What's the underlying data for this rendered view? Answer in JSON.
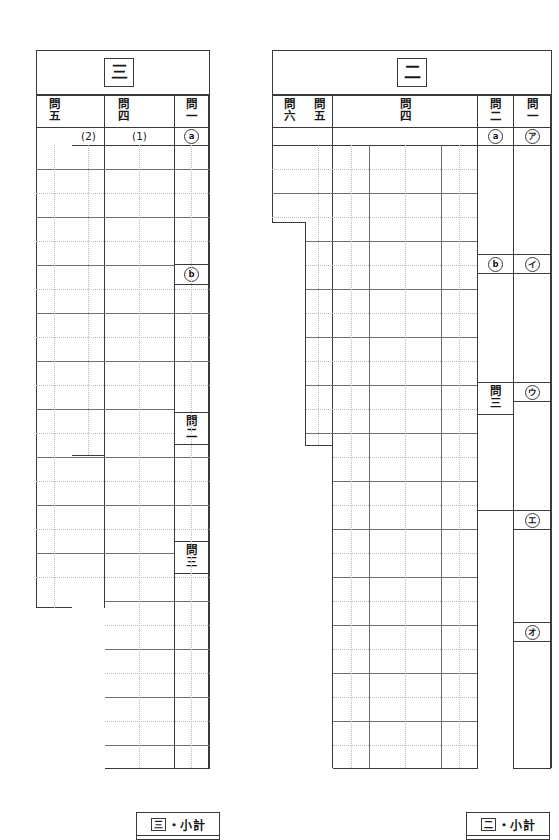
{
  "page": {
    "kind": "japanese-exam-answer-sheet",
    "width": 559,
    "height": 840,
    "background": "#ffffff",
    "rule_color": "#6e6e73",
    "outline_color": "#3a3a3a",
    "dotted_color": "#b9b9bd"
  },
  "sections": [
    {
      "id": "section-three",
      "title": "三",
      "columns": [
        {
          "id": "q5",
          "label_chars": [
            "問",
            "五"
          ]
        },
        {
          "id": "q4",
          "label_chars": [
            "問",
            "四"
          ]
        },
        {
          "id": "q1",
          "label_chars": [
            "問",
            "一"
          ]
        }
      ],
      "sub_labels": [
        {
          "id": "q4-2",
          "text": "(2)"
        },
        {
          "id": "q4-1",
          "text": "(1)"
        }
      ],
      "marks": [
        {
          "id": "mark-a",
          "text": "a",
          "circled": true
        },
        {
          "id": "mark-b",
          "text": "b",
          "circled": true
        }
      ],
      "inline_labels": [
        {
          "id": "q2-inline",
          "label_chars": [
            "問",
            "二"
          ]
        },
        {
          "id": "q3-inline",
          "label_chars": [
            "問",
            "三"
          ]
        }
      ]
    },
    {
      "id": "section-two",
      "title": "二",
      "columns": [
        {
          "id": "q6",
          "label_chars": [
            "問",
            "六"
          ]
        },
        {
          "id": "q5",
          "label_chars": [
            "問",
            "五"
          ]
        },
        {
          "id": "q4",
          "label_chars": [
            "問",
            "四"
          ]
        },
        {
          "id": "q2",
          "label_chars": [
            "問",
            "二"
          ]
        },
        {
          "id": "q1",
          "label_chars": [
            "問",
            "一"
          ]
        }
      ],
      "marks": [
        {
          "id": "mark-a",
          "text": "a",
          "circled": true
        },
        {
          "id": "mark-b",
          "text": "b",
          "circled": true
        },
        {
          "id": "mark-ア",
          "text": "ア",
          "circled": true
        },
        {
          "id": "mark-イ",
          "text": "イ",
          "circled": true
        },
        {
          "id": "mark-ウ",
          "text": "ウ",
          "circled": true
        },
        {
          "id": "mark-エ",
          "text": "エ",
          "circled": true
        },
        {
          "id": "mark-オ",
          "text": "オ",
          "circled": true
        }
      ],
      "inline_labels": [
        {
          "id": "q3-inline",
          "label_chars": [
            "問",
            "三"
          ]
        }
      ]
    }
  ],
  "footers": [
    {
      "id": "footer-three",
      "symbol": "三",
      "text": "・小計"
    },
    {
      "id": "footer-two",
      "symbol": "二",
      "text": "・小計"
    }
  ]
}
